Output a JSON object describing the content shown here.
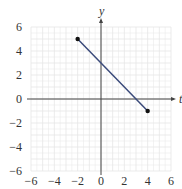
{
  "chart_data": {
    "type": "line",
    "title": "",
    "xlabel": "t",
    "ylabel": "y",
    "xlim": [
      -6,
      6
    ],
    "ylim": [
      -6,
      6
    ],
    "grid": true,
    "x_ticks": [
      -6,
      -4,
      -2,
      0,
      2,
      4,
      6
    ],
    "y_ticks": [
      -6,
      -4,
      -2,
      0,
      2,
      4,
      6
    ],
    "x_tick_labels": [
      "−6",
      "−4",
      "−2",
      "0",
      "2",
      "4",
      "6"
    ],
    "y_tick_labels": [
      "−6",
      "−4",
      "−2",
      "0",
      "2",
      "4",
      "6"
    ],
    "series": [
      {
        "name": "segment",
        "x": [
          -2,
          4
        ],
        "y": [
          5,
          -1
        ],
        "color": "#3a4a7a",
        "endpoints": "filled-dots"
      }
    ]
  },
  "colors": {
    "grid": "#e6e6e6",
    "axis": "#444444",
    "line": "#3a4a7a",
    "point": "#111111"
  }
}
